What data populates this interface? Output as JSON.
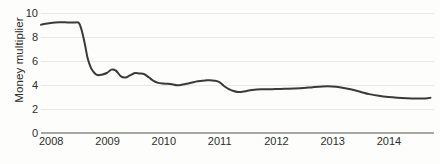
{
  "chart_data": {
    "type": "line",
    "title": "",
    "subtitle": "",
    "xlabel": "",
    "ylabel": "Money multiplier",
    "xlim": [
      2008.0,
      2015.0
    ],
    "ylim": [
      0,
      10
    ],
    "grid": true,
    "legend": false,
    "legend_position": "none",
    "line_color": "#3a3a38",
    "gridline_color": "#e9e9e4",
    "axis_color": "#a8a8a2",
    "y_ticks": [
      10,
      8,
      6,
      4,
      2,
      0
    ],
    "y_tick_labels": [
      "10",
      "8",
      "6",
      "4",
      "2",
      "0"
    ],
    "x_ticks": [
      2008,
      2009,
      2010,
      2011,
      2012,
      2013,
      2014
    ],
    "x_tick_labels": [
      "2008",
      "2009",
      "2010",
      "2011",
      "2012",
      "2013",
      "2014"
    ],
    "series": [
      {
        "name": "Money multiplier",
        "x": [
          2008.0,
          2008.08,
          2008.17,
          2008.25,
          2008.33,
          2008.42,
          2008.5,
          2008.58,
          2008.67,
          2008.72,
          2008.78,
          2008.83,
          2008.89,
          2008.95,
          2009.0,
          2009.08,
          2009.17,
          2009.25,
          2009.33,
          2009.42,
          2009.5,
          2009.58,
          2009.67,
          2009.75,
          2009.83,
          2009.92,
          2010.0,
          2010.08,
          2010.17,
          2010.25,
          2010.33,
          2010.42,
          2010.5,
          2010.58,
          2010.67,
          2010.75,
          2010.83,
          2010.92,
          2011.0,
          2011.08,
          2011.17,
          2011.25,
          2011.33,
          2011.42,
          2011.5,
          2011.58,
          2011.67,
          2011.75,
          2011.83,
          2011.92,
          2012.0,
          2012.17,
          2012.33,
          2012.5,
          2012.67,
          2012.83,
          2013.0,
          2013.17,
          2013.33,
          2013.5,
          2013.67,
          2013.83,
          2014.0,
          2014.17,
          2014.33,
          2014.5,
          2014.67,
          2014.83,
          2014.92
        ],
        "y": [
          9.02,
          9.1,
          9.16,
          9.2,
          9.22,
          9.22,
          9.21,
          9.2,
          9.18,
          8.6,
          7.4,
          6.2,
          5.4,
          5.0,
          4.83,
          4.86,
          5.0,
          5.28,
          5.2,
          4.72,
          4.62,
          4.8,
          5.0,
          4.96,
          4.92,
          4.62,
          4.34,
          4.18,
          4.12,
          4.1,
          4.06,
          3.98,
          4.02,
          4.1,
          4.18,
          4.28,
          4.34,
          4.38,
          4.4,
          4.36,
          4.24,
          3.92,
          3.68,
          3.5,
          3.42,
          3.44,
          3.52,
          3.58,
          3.62,
          3.64,
          3.64,
          3.66,
          3.68,
          3.7,
          3.74,
          3.82,
          3.88,
          3.88,
          3.8,
          3.64,
          3.44,
          3.24,
          3.1,
          3.0,
          2.94,
          2.9,
          2.88,
          2.88,
          2.94
        ]
      }
    ]
  }
}
